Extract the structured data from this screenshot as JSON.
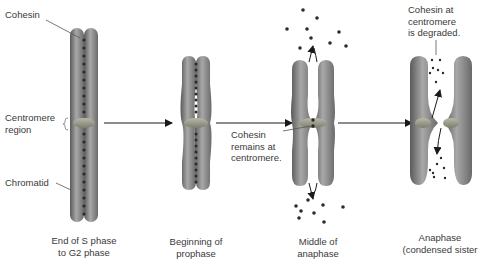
{
  "labels": {
    "cohesin": "Cohesin",
    "centromere_region_1": "Centromere",
    "centromere_region_2": "region",
    "chromatid": "Chromatid",
    "cohesin_remains_1": "Cohesin",
    "cohesin_remains_2": "remains at",
    "cohesin_remains_3": "centromere.",
    "cohesin_degraded_1": "Cohesin at",
    "cohesin_degraded_2": "centromere",
    "cohesin_degraded_3": "is degraded."
  },
  "stages": [
    {
      "line1": "End of S phase",
      "line2": "to G2 phase"
    },
    {
      "line1": "Beginning of",
      "line2": "prophase"
    },
    {
      "line1": "Middle of",
      "line2": "anaphase"
    },
    {
      "line1": "Anaphase",
      "line2": "(condensed sister"
    }
  ],
  "colors": {
    "chromatid": "#8f8f8f",
    "chromatid_dark": "#5e5e5e",
    "cohesin": "#2b2b2b",
    "arrow": "#1a1a1a",
    "text": "#3a3a3a"
  }
}
